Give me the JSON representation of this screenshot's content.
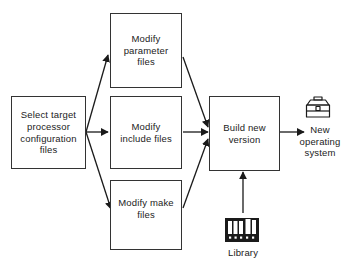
{
  "diagram": {
    "type": "flowchart",
    "background_color": "#ffffff",
    "line_color": "#333333",
    "text_color": "#222222",
    "nodes": [
      {
        "id": "select",
        "label": "Select target processor configuration files",
        "lines": [
          "Select target",
          "processor",
          "configuration",
          "files"
        ],
        "shape": "rectangle"
      },
      {
        "id": "parameter",
        "label": "Modify parameter files",
        "lines": [
          "Modify",
          "parameter",
          "files"
        ],
        "shape": "rectangle"
      },
      {
        "id": "include",
        "label": "Modify include files",
        "lines": [
          "Modify",
          "include files"
        ],
        "shape": "rectangle"
      },
      {
        "id": "make",
        "label": "Modify make files",
        "lines": [
          "Modify make",
          "files"
        ],
        "shape": "rectangle"
      },
      {
        "id": "build",
        "label": "Build new version",
        "lines": [
          "Build new",
          "version"
        ],
        "shape": "rectangle"
      },
      {
        "id": "newos",
        "label": "New operating system",
        "lines": [
          "New",
          "operating",
          "system"
        ],
        "shape": "icon-label",
        "icon": "toolbox-icon"
      },
      {
        "id": "library",
        "label": "Library",
        "lines": [
          "Library"
        ],
        "shape": "icon-label",
        "icon": "books-icon"
      }
    ],
    "edges": [
      {
        "from": "select",
        "to": "parameter"
      },
      {
        "from": "select",
        "to": "include"
      },
      {
        "from": "select",
        "to": "make"
      },
      {
        "from": "parameter",
        "to": "build"
      },
      {
        "from": "include",
        "to": "build"
      },
      {
        "from": "make",
        "to": "build"
      },
      {
        "from": "build",
        "to": "newos"
      },
      {
        "from": "library",
        "to": "build"
      }
    ]
  }
}
